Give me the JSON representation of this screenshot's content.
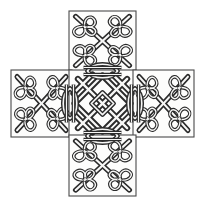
{
  "artwork": {
    "title": "Celtic Interlace Greek Cross",
    "form": "plus-shaped cross of five square panels",
    "medium": "black ink line drawing on white",
    "canvas": {
      "width": 205,
      "height": 209
    },
    "colors": {
      "background": "#ffffff",
      "plate_fill": "#fdfdfc",
      "ink": "#2b2b2b",
      "border": "#4a4a4a",
      "highlight": "#f7f7f6"
    },
    "panels": [
      {
        "id": "top",
        "name": "top-arm-panel",
        "motif": "four trefoil knots around central X crossing",
        "knot_count": 4,
        "x": 69,
        "y": 11,
        "w": 67,
        "h": 61
      },
      {
        "id": "left",
        "name": "left-arm-panel",
        "motif": "four trefoil knots around central X crossing",
        "knot_count": 4,
        "x": 11,
        "y": 70,
        "w": 61,
        "h": 67
      },
      {
        "id": "center",
        "name": "center-panel",
        "motif": "woven diamond lattice with lens eyes on all four sides",
        "knot_count": 1,
        "x": 69,
        "y": 70,
        "w": 67,
        "h": 67
      },
      {
        "id": "right",
        "name": "right-arm-panel",
        "motif": "four trefoil knots around central X crossing",
        "knot_count": 4,
        "x": 133,
        "y": 70,
        "w": 61,
        "h": 67
      },
      {
        "id": "bottom",
        "name": "bottom-arm-panel",
        "motif": "four trefoil knots around central X crossing",
        "knot_count": 4,
        "x": 69,
        "y": 135,
        "w": 67,
        "h": 61
      }
    ],
    "junction_motifs": [
      {
        "name": "lens-eye-top",
        "orientation": "horizontal",
        "cx": 102,
        "cy": 71
      },
      {
        "name": "lens-eye-bottom",
        "orientation": "horizontal",
        "cx": 102,
        "cy": 136
      },
      {
        "name": "lens-eye-left",
        "orientation": "vertical",
        "cx": 70,
        "cy": 103
      },
      {
        "name": "lens-eye-right",
        "orientation": "vertical",
        "cx": 135,
        "cy": 103
      }
    ]
  }
}
